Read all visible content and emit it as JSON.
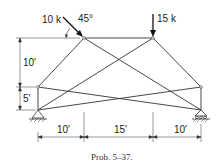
{
  "figure": {
    "caption": "Prob. 5–37.",
    "loads": [
      {
        "label": "10 k",
        "angle_label": "45°",
        "direction": "down-right at 45°"
      },
      {
        "label": "15 k",
        "direction": "down"
      }
    ],
    "vertical_dims": [
      "10′",
      "5′"
    ],
    "horizontal_dims": [
      "10′",
      "15′",
      "10′"
    ],
    "nodes": {
      "A": [
        38,
        110
      ],
      "B": [
        201,
        110
      ],
      "C": [
        38,
        87
      ],
      "D": [
        201,
        87
      ],
      "E": [
        84,
        38
      ],
      "F": [
        153,
        38
      ]
    },
    "members": [
      [
        "E",
        "F"
      ],
      [
        "C",
        "E"
      ],
      [
        "F",
        "D"
      ],
      [
        "C",
        "A"
      ],
      [
        "D",
        "B"
      ],
      [
        "C",
        "F"
      ],
      [
        "E",
        "B"
      ],
      [
        "C",
        "B"
      ],
      [
        "A",
        "D"
      ],
      [
        "A",
        "F"
      ]
    ]
  }
}
